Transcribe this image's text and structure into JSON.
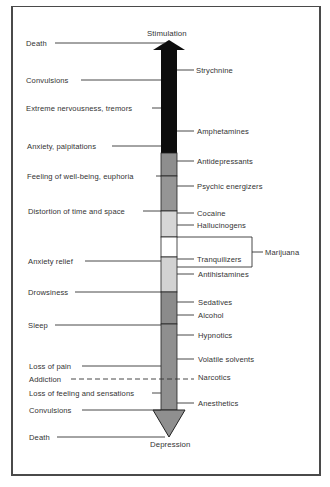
{
  "diagram": {
    "top_label": "Stimulation",
    "bottom_label": "Depression",
    "colors": {
      "black": "#0d0d0d",
      "dark_gray": "#8a8a8a",
      "mid_gray": "#939393",
      "light_gray": "#d4d4d4",
      "white": "#ffffff",
      "frame": "#4a4a4a"
    },
    "effects": [
      {
        "label": "Death",
        "y": 43
      },
      {
        "label": "Convulsions",
        "y": 80
      },
      {
        "label": "Extreme nervousness, tremors",
        "y": 108
      },
      {
        "label": "Anxiety, palpitations",
        "y": 146
      },
      {
        "label": "Feeling of well-being, euphoria",
        "y": 176
      },
      {
        "label": "Distortion of time and space",
        "y": 211
      },
      {
        "label": "Anxiety relief",
        "y": 261
      },
      {
        "label": "Drowsiness",
        "y": 292
      },
      {
        "label": "Sleep",
        "y": 325
      },
      {
        "label": "Loss of pain",
        "y": 366
      },
      {
        "label": "Addiction",
        "y": 379,
        "dashed": true
      },
      {
        "label": "Loss of feeling and sensations",
        "y": 393
      },
      {
        "label": "Convulsions",
        "y": 410
      },
      {
        "label": "Death",
        "y": 437
      }
    ],
    "drugs": [
      {
        "label": "Strychnine",
        "y": 70
      },
      {
        "label": "Amphetamines",
        "y": 131
      },
      {
        "label": "Antidepressants",
        "y": 161
      },
      {
        "label": "Psychic energizers",
        "y": 186
      },
      {
        "label": "Cocaine",
        "y": 213
      },
      {
        "label": "Hallucinogens",
        "y": 225
      },
      {
        "label": "Tranquilizers",
        "y": 259
      },
      {
        "label": "Antihistamines",
        "y": 274
      },
      {
        "label": "Sedatives",
        "y": 302
      },
      {
        "label": "Alcohol",
        "y": 315
      },
      {
        "label": "Hypnotics",
        "y": 335
      },
      {
        "label": "Volatile solvents",
        "y": 359
      },
      {
        "label": "Narcotics",
        "y": 377,
        "dashed": true
      },
      {
        "label": "Anesthetics",
        "y": 403
      }
    ],
    "bracket": {
      "label": "Marijuana",
      "y_top": 237,
      "y_bottom": 265
    }
  }
}
